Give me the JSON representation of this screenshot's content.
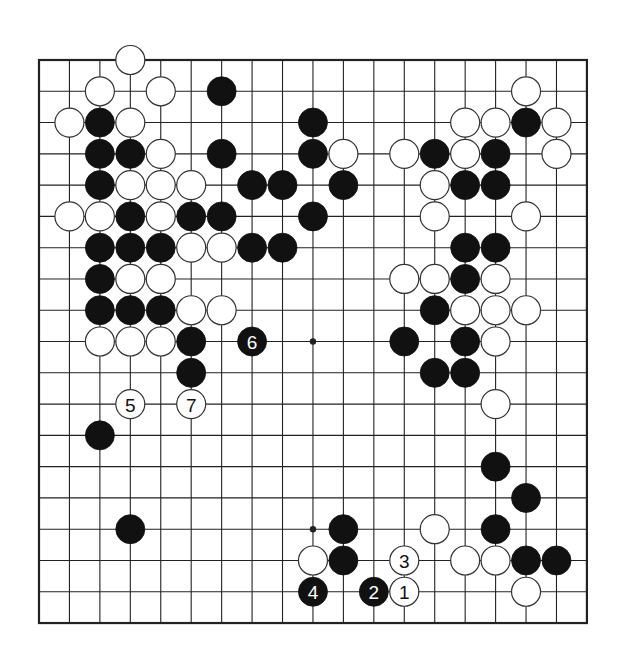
{
  "board": {
    "size": 19,
    "origin_x": 39,
    "origin_y": 60,
    "step_x": 30.44,
    "step_y": 31.28,
    "stone_radius": 14.5,
    "line_color": "#222222",
    "border_width": 2.2,
    "line_width": 1.1,
    "star_points": [
      [
        9,
        9
      ],
      [
        9,
        15
      ]
    ],
    "colors": {
      "black": "#111111",
      "white": "#ffffff",
      "white_stroke": "#333333",
      "black_label": "#ffffff",
      "white_label": "#111111"
    }
  },
  "stones": [
    {
      "c": 3,
      "r": 0,
      "color": "white"
    },
    {
      "c": 2,
      "r": 1,
      "color": "white"
    },
    {
      "c": 4,
      "r": 1,
      "color": "white"
    },
    {
      "c": 6,
      "r": 1,
      "color": "black"
    },
    {
      "c": 16,
      "r": 1,
      "color": "white"
    },
    {
      "c": 1,
      "r": 2,
      "color": "white"
    },
    {
      "c": 2,
      "r": 2,
      "color": "black"
    },
    {
      "c": 3,
      "r": 2,
      "color": "white"
    },
    {
      "c": 9,
      "r": 2,
      "color": "black"
    },
    {
      "c": 14,
      "r": 2,
      "color": "white"
    },
    {
      "c": 15,
      "r": 2,
      "color": "white"
    },
    {
      "c": 16,
      "r": 2,
      "color": "black"
    },
    {
      "c": 17,
      "r": 2,
      "color": "white"
    },
    {
      "c": 2,
      "r": 3,
      "color": "black"
    },
    {
      "c": 3,
      "r": 3,
      "color": "black"
    },
    {
      "c": 4,
      "r": 3,
      "color": "white"
    },
    {
      "c": 6,
      "r": 3,
      "color": "black"
    },
    {
      "c": 9,
      "r": 3,
      "color": "black"
    },
    {
      "c": 10,
      "r": 3,
      "color": "white"
    },
    {
      "c": 12,
      "r": 3,
      "color": "white"
    },
    {
      "c": 13,
      "r": 3,
      "color": "black"
    },
    {
      "c": 14,
      "r": 3,
      "color": "white"
    },
    {
      "c": 15,
      "r": 3,
      "color": "black"
    },
    {
      "c": 17,
      "r": 3,
      "color": "white"
    },
    {
      "c": 2,
      "r": 4,
      "color": "black"
    },
    {
      "c": 3,
      "r": 4,
      "color": "white"
    },
    {
      "c": 4,
      "r": 4,
      "color": "white"
    },
    {
      "c": 5,
      "r": 4,
      "color": "white"
    },
    {
      "c": 7,
      "r": 4,
      "color": "black"
    },
    {
      "c": 8,
      "r": 4,
      "color": "black"
    },
    {
      "c": 10,
      "r": 4,
      "color": "black"
    },
    {
      "c": 13,
      "r": 4,
      "color": "white"
    },
    {
      "c": 14,
      "r": 4,
      "color": "black"
    },
    {
      "c": 15,
      "r": 4,
      "color": "black"
    },
    {
      "c": 1,
      "r": 5,
      "color": "white"
    },
    {
      "c": 2,
      "r": 5,
      "color": "white"
    },
    {
      "c": 3,
      "r": 5,
      "color": "black"
    },
    {
      "c": 4,
      "r": 5,
      "color": "white"
    },
    {
      "c": 5,
      "r": 5,
      "color": "black"
    },
    {
      "c": 6,
      "r": 5,
      "color": "black"
    },
    {
      "c": 9,
      "r": 5,
      "color": "black"
    },
    {
      "c": 13,
      "r": 5,
      "color": "white"
    },
    {
      "c": 16,
      "r": 5,
      "color": "white"
    },
    {
      "c": 2,
      "r": 6,
      "color": "black"
    },
    {
      "c": 3,
      "r": 6,
      "color": "black"
    },
    {
      "c": 4,
      "r": 6,
      "color": "black"
    },
    {
      "c": 5,
      "r": 6,
      "color": "white"
    },
    {
      "c": 6,
      "r": 6,
      "color": "white"
    },
    {
      "c": 7,
      "r": 6,
      "color": "black"
    },
    {
      "c": 8,
      "r": 6,
      "color": "black"
    },
    {
      "c": 14,
      "r": 6,
      "color": "black"
    },
    {
      "c": 15,
      "r": 6,
      "color": "black"
    },
    {
      "c": 2,
      "r": 7,
      "color": "black"
    },
    {
      "c": 3,
      "r": 7,
      "color": "white"
    },
    {
      "c": 4,
      "r": 7,
      "color": "white"
    },
    {
      "c": 12,
      "r": 7,
      "color": "white"
    },
    {
      "c": 13,
      "r": 7,
      "color": "white"
    },
    {
      "c": 14,
      "r": 7,
      "color": "black"
    },
    {
      "c": 15,
      "r": 7,
      "color": "white"
    },
    {
      "c": 2,
      "r": 8,
      "color": "black"
    },
    {
      "c": 3,
      "r": 8,
      "color": "black"
    },
    {
      "c": 4,
      "r": 8,
      "color": "black"
    },
    {
      "c": 5,
      "r": 8,
      "color": "white"
    },
    {
      "c": 6,
      "r": 8,
      "color": "white"
    },
    {
      "c": 13,
      "r": 8,
      "color": "black"
    },
    {
      "c": 14,
      "r": 8,
      "color": "white"
    },
    {
      "c": 15,
      "r": 8,
      "color": "white"
    },
    {
      "c": 16,
      "r": 8,
      "color": "white"
    },
    {
      "c": 2,
      "r": 9,
      "color": "white"
    },
    {
      "c": 3,
      "r": 9,
      "color": "white"
    },
    {
      "c": 4,
      "r": 9,
      "color": "white"
    },
    {
      "c": 5,
      "r": 9,
      "color": "black"
    },
    {
      "c": 7,
      "r": 9,
      "color": "black",
      "label": "6"
    },
    {
      "c": 12,
      "r": 9,
      "color": "black"
    },
    {
      "c": 14,
      "r": 9,
      "color": "black"
    },
    {
      "c": 15,
      "r": 9,
      "color": "white"
    },
    {
      "c": 5,
      "r": 10,
      "color": "black"
    },
    {
      "c": 13,
      "r": 10,
      "color": "black"
    },
    {
      "c": 14,
      "r": 10,
      "color": "black"
    },
    {
      "c": 3,
      "r": 11,
      "color": "white",
      "label": "5"
    },
    {
      "c": 5,
      "r": 11,
      "color": "white",
      "label": "7"
    },
    {
      "c": 15,
      "r": 11,
      "color": "white"
    },
    {
      "c": 2,
      "r": 12,
      "color": "black"
    },
    {
      "c": 15,
      "r": 13,
      "color": "black"
    },
    {
      "c": 16,
      "r": 14,
      "color": "black"
    },
    {
      "c": 3,
      "r": 15,
      "color": "black"
    },
    {
      "c": 10,
      "r": 15,
      "color": "black"
    },
    {
      "c": 13,
      "r": 15,
      "color": "white"
    },
    {
      "c": 15,
      "r": 15,
      "color": "black"
    },
    {
      "c": 9,
      "r": 16,
      "color": "white"
    },
    {
      "c": 10,
      "r": 16,
      "color": "black"
    },
    {
      "c": 12,
      "r": 16,
      "color": "white",
      "label": "3"
    },
    {
      "c": 14,
      "r": 16,
      "color": "white"
    },
    {
      "c": 15,
      "r": 16,
      "color": "white"
    },
    {
      "c": 16,
      "r": 16,
      "color": "black"
    },
    {
      "c": 17,
      "r": 16,
      "color": "black"
    },
    {
      "c": 9,
      "r": 17,
      "color": "black",
      "label": "4"
    },
    {
      "c": 11,
      "r": 17,
      "color": "black",
      "label": "2"
    },
    {
      "c": 12,
      "r": 17,
      "color": "white",
      "label": "1"
    },
    {
      "c": 16,
      "r": 17,
      "color": "white"
    }
  ]
}
